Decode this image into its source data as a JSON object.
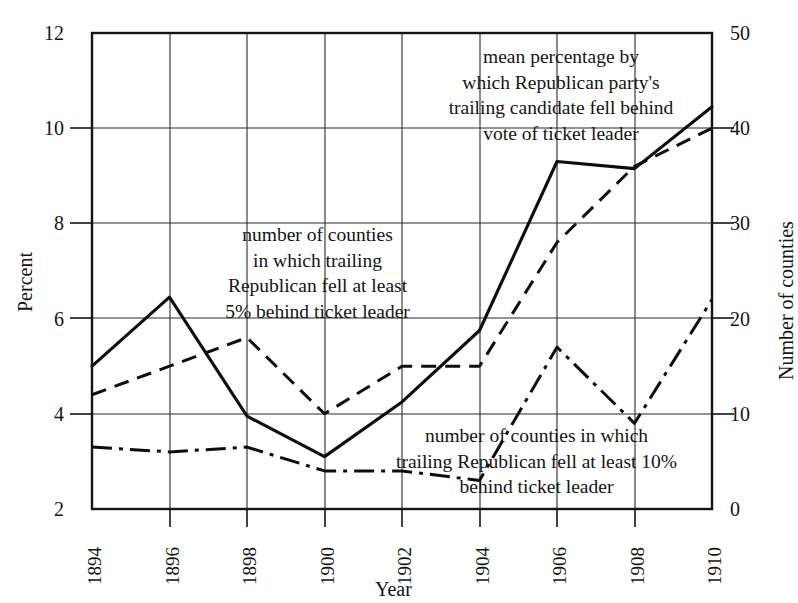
{
  "chart_data": {
    "type": "line",
    "title": "",
    "xlabel": "Year",
    "ylabel": "Percent",
    "y2label": "Number of counties",
    "x": [
      1894,
      1896,
      1898,
      1900,
      1902,
      1904,
      1906,
      1908,
      1910
    ],
    "xtick_labels": [
      "1894",
      "1896",
      "1898",
      "1900",
      "1902",
      "1904",
      "1906",
      "1908",
      "1910"
    ],
    "ylim": [
      2,
      12
    ],
    "ytick_labels": [
      "12",
      "10",
      "8",
      "6",
      "4",
      "2"
    ],
    "ytick_values": [
      12,
      10,
      8,
      6,
      4,
      2
    ],
    "y2lim": [
      0,
      50
    ],
    "y2tick_labels": [
      "50",
      "40",
      "30",
      "20",
      "10",
      "0"
    ],
    "y2tick_values": [
      50,
      40,
      30,
      20,
      10,
      0
    ],
    "grid": true,
    "legend": "annotations-inline",
    "series": [
      {
        "name": "mean percentage by which Republican party's trailing candidate fell behind vote of ticket leader",
        "axis": "left",
        "units": "percent",
        "style": "solid",
        "values": [
          5.0,
          6.45,
          3.95,
          3.1,
          4.25,
          5.75,
          9.3,
          9.15,
          10.45
        ]
      },
      {
        "name": "number of counties in which trailing Republican fell at least 5% behind ticket leader",
        "axis": "right",
        "units": "counties",
        "style": "dashed",
        "values": [
          12,
          15,
          18,
          10,
          15,
          15,
          28,
          36,
          40
        ]
      },
      {
        "name": "number of counties in which trailing Republican fell at least 10% behind ticket leader",
        "axis": "right",
        "units": "counties",
        "style": "dash-dot",
        "values": [
          6.5,
          6.0,
          6.5,
          4.0,
          4.0,
          3.0,
          17.0,
          9.0,
          22.0
        ]
      }
    ],
    "annotations": [
      {
        "id": "mean-percentage-note",
        "lines": [
          "mean percentage by",
          "which Republican party's",
          "trailing candidate fell behind",
          "vote of ticket leader"
        ]
      },
      {
        "id": "counties-5pct-note",
        "lines": [
          "number of counties",
          "in which trailing",
          "Republican fell at least",
          "5% behind ticket leader"
        ]
      },
      {
        "id": "counties-10pct-note",
        "lines": [
          "number of counties in which",
          "trailing Republican fell at least 10%",
          "behind ticket leader"
        ]
      }
    ]
  },
  "colors": {
    "ink": "#141414",
    "grid": "#2b2b2b",
    "background": "#ffffff"
  }
}
